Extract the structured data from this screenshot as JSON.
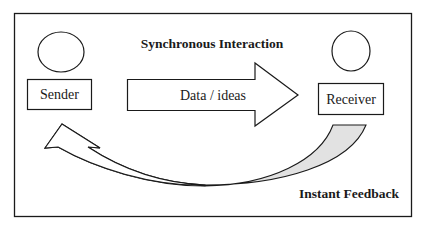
{
  "diagram": {
    "title": "Synchronous Interaction",
    "sender": {
      "label": "Sender"
    },
    "receiver": {
      "label": "Receiver"
    },
    "forward_arrow": {
      "label": "Data / ideas"
    },
    "feedback_arrow": {
      "label": "Instant Feedback"
    },
    "colors": {
      "stroke": "#1a1a1a",
      "feedback_fill": "#e2e2e2",
      "background": "#ffffff"
    }
  }
}
